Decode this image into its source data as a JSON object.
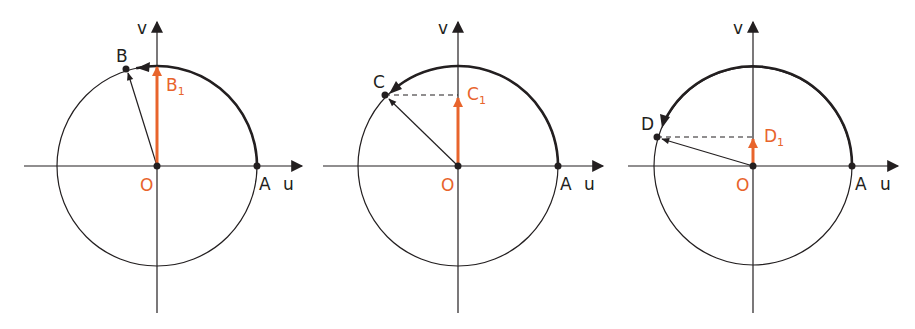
{
  "figure": {
    "colors": {
      "line": "#231f20",
      "accent": "#e8642c",
      "background": "#ffffff"
    },
    "axis_labels": {
      "horizontal": "u",
      "vertical": "v"
    },
    "panels": [
      {
        "id": "panel-1",
        "origin_label": "O",
        "start_label": "A",
        "point_label": "B",
        "projection_label": "B",
        "projection_sub": "1",
        "angle_deg": 102
      },
      {
        "id": "panel-2",
        "origin_label": "O",
        "start_label": "A",
        "point_label": "C",
        "projection_label": "C",
        "projection_sub": "1",
        "angle_deg": 135
      },
      {
        "id": "panel-3",
        "origin_label": "O",
        "start_label": "A",
        "point_label": "D",
        "projection_label": "D",
        "projection_sub": "1",
        "angle_deg": 163
      }
    ]
  }
}
